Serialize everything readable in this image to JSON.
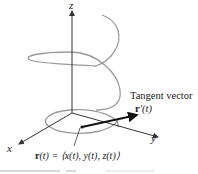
{
  "figure": {
    "axes": {
      "x_label": "x",
      "y_label": "y",
      "z_label": "z"
    },
    "curve": {
      "type": "helix",
      "color": "#9a9a9a"
    },
    "tangent": {
      "title": "Tangent vector",
      "symbol_bold": "r",
      "symbol_rest": "′(t)",
      "color": "#111111"
    },
    "position": {
      "symbol_bold": "r",
      "equation_rest": "(t) = ⟨x(t), y(t), z(t)⟩"
    },
    "colors": {
      "axis": "#333333",
      "text": "#222222",
      "background": "#ffffff"
    }
  }
}
